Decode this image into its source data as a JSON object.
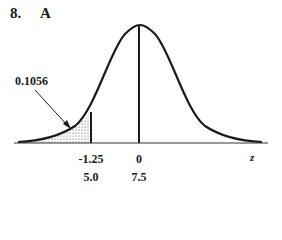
{
  "problem": {
    "number": "8.",
    "answer": "A"
  },
  "diagram": {
    "type": "normal-curve",
    "shaded_region": "left tail",
    "area_label": "0.1056",
    "axis_label": "z",
    "ticks": [
      {
        "z": "-1.25",
        "x": "5.0"
      },
      {
        "z": "0",
        "x": "7.5"
      }
    ]
  }
}
